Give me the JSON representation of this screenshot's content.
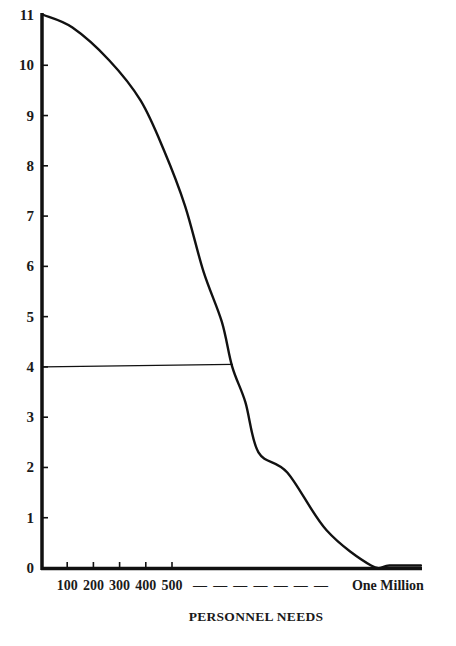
{
  "chart_data": {
    "type": "line",
    "title": "",
    "xlabel": "PERSONNEL NEEDS",
    "ylabel": "",
    "ylim": [
      0,
      11
    ],
    "xlim_units": [
      0,
      14.6
    ],
    "x_axis_note": "x values expressed in axis units where 1 unit = one tick (100 personnel); right end labeled 'One Million'",
    "y_ticks": [
      0,
      1,
      2,
      3,
      4,
      5,
      6,
      7,
      8,
      9,
      10,
      11
    ],
    "x_ticks": [
      {
        "label": "100",
        "x": 1
      },
      {
        "label": "200",
        "x": 2
      },
      {
        "label": "300",
        "x": 3
      },
      {
        "label": "400",
        "x": 4
      },
      {
        "label": "500",
        "x": 5
      }
    ],
    "x_dash_label": "— — — — — — —",
    "x_end_label": {
      "label": "One Million",
      "x": 14.5
    },
    "grid": false,
    "legend": "none",
    "series": [
      {
        "name": "curve",
        "x": [
          0.1,
          1.2,
          2.6,
          3.8,
          4.7,
          5.5,
          6.2,
          6.9,
          7.3,
          7.8,
          8.3,
          9.4,
          10.9,
          12.6,
          13.3,
          14.5
        ],
        "y": [
          11.0,
          10.75,
          10.1,
          9.3,
          8.3,
          7.2,
          5.9,
          4.9,
          4.0,
          3.3,
          2.3,
          1.9,
          0.75,
          0.05,
          0.05,
          0.05
        ]
      },
      {
        "name": "reference-line-at-4",
        "x": [
          0.1,
          7.3
        ],
        "y": [
          4.0,
          4.05
        ]
      }
    ]
  }
}
